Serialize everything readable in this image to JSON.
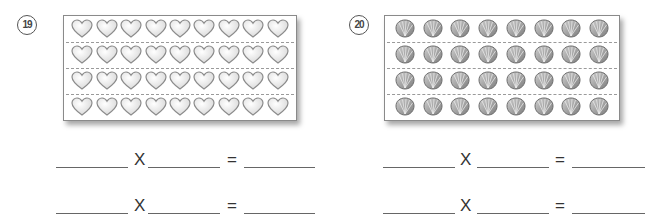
{
  "problems": [
    {
      "number": "19",
      "number_display": "⑲",
      "item": "heart",
      "rows": 4,
      "cols": 9,
      "equations": [
        {
          "left": "",
          "operator": "X",
          "right": "",
          "equals": "=",
          "result": ""
        },
        {
          "left": "",
          "operator": "X",
          "right": "",
          "equals": "=",
          "result": ""
        }
      ]
    },
    {
      "number": "20",
      "number_display": "⑳",
      "item": "shell",
      "rows": 4,
      "cols": 8,
      "equations": [
        {
          "left": "",
          "operator": "X",
          "right": "",
          "equals": "=",
          "result": ""
        },
        {
          "left": "",
          "operator": "X",
          "right": "",
          "equals": "=",
          "result": ""
        }
      ]
    }
  ],
  "colors": {
    "heart_fill": "#f2f2f2",
    "heart_stroke": "#8c8c8c",
    "shell_fill": "#9a9a9a",
    "shell_stroke": "#6e6e6e",
    "dash": "#9a9a9a",
    "line": "#666666"
  }
}
